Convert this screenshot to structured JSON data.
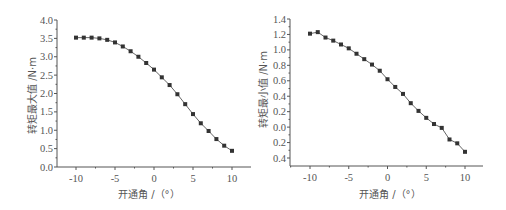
{
  "chart_data": [
    {
      "type": "line",
      "title": "",
      "xlabel": "开通角 /（°）",
      "ylabel": "转矩最大值 /N·m",
      "x": [
        -10,
        -9,
        -8,
        -7,
        -6,
        -5,
        -4,
        -3,
        -2,
        -1,
        0,
        1,
        2,
        3,
        4,
        5,
        6,
        7,
        8,
        9,
        10
      ],
      "series": [
        {
          "name": "转矩最大值",
          "marker": "square",
          "values": [
            3.52,
            3.52,
            3.52,
            3.5,
            3.46,
            3.39,
            3.28,
            3.15,
            3.0,
            2.83,
            2.65,
            2.44,
            2.23,
            1.98,
            1.71,
            1.44,
            1.19,
            0.98,
            0.76,
            0.58,
            0.44
          ]
        }
      ],
      "xlim": [
        -12.5,
        12.5
      ],
      "ylim": [
        0,
        4.0
      ],
      "xticks": [
        -10,
        -5,
        0,
        5,
        10
      ],
      "xtick_labels": [
        "-10",
        "-5",
        "0",
        "5",
        "10"
      ],
      "yticks": [
        0,
        0.5,
        1.0,
        1.5,
        2.0,
        2.5,
        3.0,
        3.5,
        4.0
      ],
      "ytick_labels": [
        "0.0",
        "0.5",
        "1.0",
        "1.5",
        "2.0",
        "2.5",
        "3.0",
        "3.5",
        "4.0"
      ],
      "grid": false,
      "legend": "none"
    },
    {
      "type": "line",
      "title": "",
      "xlabel": "开通角 /（°）",
      "ylabel": "转矩最小值 /N·m",
      "x": [
        -10,
        -9,
        -8,
        -7,
        -6,
        -5,
        -4,
        -3,
        -2,
        -1,
        0,
        1,
        2,
        3,
        4,
        5,
        6,
        7,
        8,
        9,
        10
      ],
      "series": [
        {
          "name": "转矩最小值",
          "marker": "square",
          "values": [
            1.21,
            1.23,
            1.16,
            1.12,
            1.07,
            1.02,
            0.95,
            0.88,
            0.81,
            0.73,
            0.62,
            0.52,
            0.43,
            0.31,
            0.21,
            0.12,
            0.04,
            -0.01,
            -0.16,
            -0.21,
            -0.32
          ]
        }
      ],
      "xlim": [
        -12.5,
        12.5
      ],
      "ylim": [
        -0.4,
        1.4
      ],
      "xticks": [
        -10,
        -5,
        0,
        5,
        10
      ],
      "xtick_labels": [
        "-10",
        "-5",
        "0",
        "5",
        "10"
      ],
      "yticks": [
        -0.4,
        -0.2,
        0.0,
        0.2,
        0.4,
        0.6,
        0.8,
        1.0,
        1.2,
        1.4
      ],
      "ytick_labels": [
        "0.4",
        "0.2",
        "0.0",
        "0.2",
        "0.4",
        "0.6",
        "0.8",
        "1.0",
        "1.2",
        "1.4"
      ],
      "grid": false,
      "legend": "none"
    }
  ],
  "colors": {
    "line": "#666666",
    "marker": "#333333",
    "axis": "#555555",
    "text": "#555555"
  }
}
